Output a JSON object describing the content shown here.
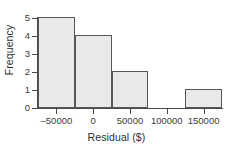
{
  "chart_data": {
    "type": "bar",
    "title": "",
    "subtitle": "",
    "xlabel": "Residual ($)",
    "ylabel": "Frequency",
    "xlim": [
      -75000,
      175000
    ],
    "ylim": [
      0,
      5
    ],
    "grid": false,
    "legend": null,
    "bin_width": 50000,
    "bins": [
      {
        "label": "-75000 to -25000",
        "left": -75000,
        "right": -25000,
        "center": -50000,
        "value": 5
      },
      {
        "label": "-25000 to 25000",
        "left": -25000,
        "right": 25000,
        "center": 0,
        "value": 4
      },
      {
        "label": "25000 to 75000",
        "left": 25000,
        "right": 75000,
        "center": 50000,
        "value": 2
      },
      {
        "label": "75000 to 125000",
        "left": 75000,
        "right": 125000,
        "center": 100000,
        "value": 0
      },
      {
        "label": "125000 to 175000",
        "left": 125000,
        "right": 175000,
        "center": 150000,
        "value": 1
      }
    ],
    "categories": [
      "-50000",
      "0",
      "50000",
      "100000",
      "150000"
    ],
    "values": [
      5,
      4,
      2,
      0,
      1
    ],
    "xticks": [
      {
        "value": -50000,
        "label": "–50000"
      },
      {
        "value": 0,
        "label": "0"
      },
      {
        "value": 50000,
        "label": "50000"
      },
      {
        "value": 100000,
        "label": "100000"
      },
      {
        "value": 150000,
        "label": "150000"
      }
    ],
    "yticks": [
      {
        "value": 0,
        "label": "0"
      },
      {
        "value": 1,
        "label": "1"
      },
      {
        "value": 2,
        "label": "2"
      },
      {
        "value": 3,
        "label": "3"
      },
      {
        "value": 4,
        "label": "4"
      },
      {
        "value": 5,
        "label": "5"
      }
    ],
    "colors": {
      "bar_fill": "#e9e9e9",
      "bar_border": "#575757",
      "axis": "#4a4a4a",
      "text": "#2f2f2f",
      "background": "#ffffff"
    }
  }
}
